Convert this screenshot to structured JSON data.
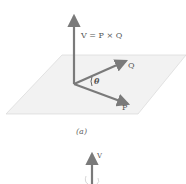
{
  "figure_a": {
    "labels": {
      "v_equation": "V = P × Q",
      "q": "Q",
      "p": "P",
      "theta": "θ"
    },
    "caption": "(a)"
  },
  "figure_b": {
    "labels": {
      "v": "V"
    }
  },
  "colors": {
    "vector": "#7a7a7a",
    "plane_fill": "#f2f2f2",
    "plane_edge": "#d4d4d4",
    "text": "#555555"
  }
}
